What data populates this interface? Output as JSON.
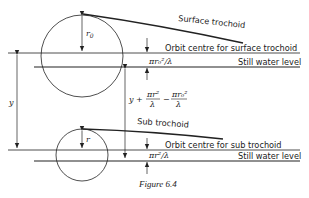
{
  "figure": {
    "caption": "Figure 6.4",
    "labels": {
      "surface_trochoid": "Surface trochoid",
      "orbit_centre_surface": "Orbit centre for surface trochoid",
      "still_water_top": "Still water level",
      "sub_trochoid": "Sub trochoid",
      "orbit_centre_sub": "Orbit centre for sub trochoid",
      "still_water_bottom": "Still water level"
    },
    "math": {
      "r0": "r",
      "r0_sub": "0",
      "r": "r",
      "y": "y",
      "offset_top": "πr₀²/λ",
      "offset_bottom": "πr²/λ",
      "mid_y_plus": "y +",
      "mid_frac1_num": "πr²",
      "mid_frac1_den": "λ",
      "mid_minus": "−",
      "mid_frac2_num": "πr₀²",
      "mid_frac2_den": "λ"
    }
  }
}
